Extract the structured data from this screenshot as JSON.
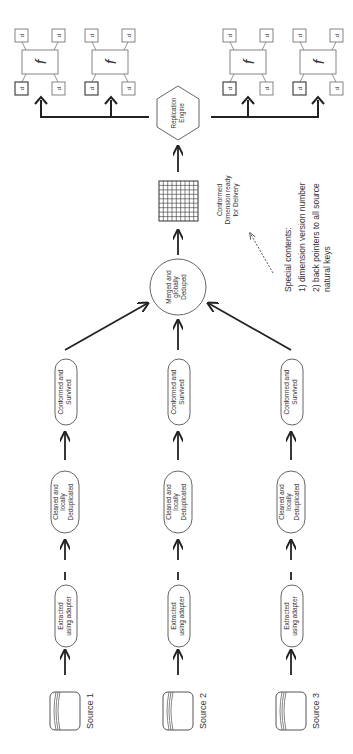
{
  "diagram": {
    "sources": [
      {
        "label": "Source 1",
        "extract": [
          "Extracted",
          "using adapter"
        ],
        "clean": [
          "Cleaned and",
          "locally",
          "Deduplicated"
        ],
        "conform": [
          "Conformed and",
          "Survived"
        ]
      },
      {
        "label": "Source 2",
        "extract": [
          "Extracted",
          "using adapter"
        ],
        "clean": [
          "Cleaned and",
          "locally",
          "Deduplicated"
        ],
        "conform": [
          "Conformed and",
          "Survived"
        ]
      },
      {
        "label": "Source 3",
        "extract": [
          "Extracted",
          "using adapter"
        ],
        "clean": [
          "Cleaned and",
          "locally",
          "Deduplicated"
        ],
        "conform": [
          "Conformed and",
          "Survived"
        ]
      }
    ],
    "merge": [
      "Merged and",
      "globally",
      "Deduped"
    ],
    "conformed_dimension": [
      "Conformed",
      "Dimension ready",
      "for Delivery"
    ],
    "replication": [
      "Replication",
      "Engine"
    ],
    "special": {
      "title": "Special contents:",
      "items": [
        "1) dimension version number",
        "2) back pointers to all source",
        "natural keys"
      ]
    },
    "fact_symbol": "f",
    "dim_symbol": "d",
    "colors": {
      "line": "#222222",
      "shape": "#555555",
      "text": "#333333"
    }
  }
}
